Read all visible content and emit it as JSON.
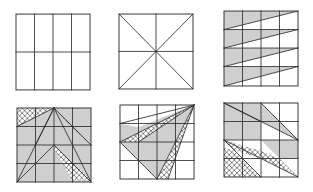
{
  "figure": {
    "colors": {
      "line": "#2a2a2a",
      "shade": "#cfcfcf",
      "hatch": "#2a2a2a",
      "background": "#ffffff"
    },
    "panels": [
      {
        "id": "p1",
        "row": 1,
        "col": 1,
        "x": 16,
        "y": 14,
        "size": 74,
        "type": "grid-4x2"
      },
      {
        "id": "p2",
        "row": 1,
        "col": 2,
        "x": 119,
        "y": 14,
        "size": 74,
        "type": "cross-diagonals"
      },
      {
        "id": "p3",
        "row": 1,
        "col": 3,
        "x": 224,
        "y": 11,
        "size": 74,
        "type": "striped-triangles"
      },
      {
        "id": "p4",
        "row": 2,
        "col": 1,
        "x": 17,
        "y": 108,
        "size": 74,
        "type": "hatched-fan-apex-top"
      },
      {
        "id": "p5",
        "row": 2,
        "col": 2,
        "x": 120,
        "y": 105,
        "size": 74,
        "type": "hatched-fan-apex-corner"
      },
      {
        "id": "p6",
        "row": 2,
        "col": 3,
        "x": 224,
        "y": 103,
        "size": 74,
        "type": "hatched-diagonal-bands"
      }
    ]
  }
}
